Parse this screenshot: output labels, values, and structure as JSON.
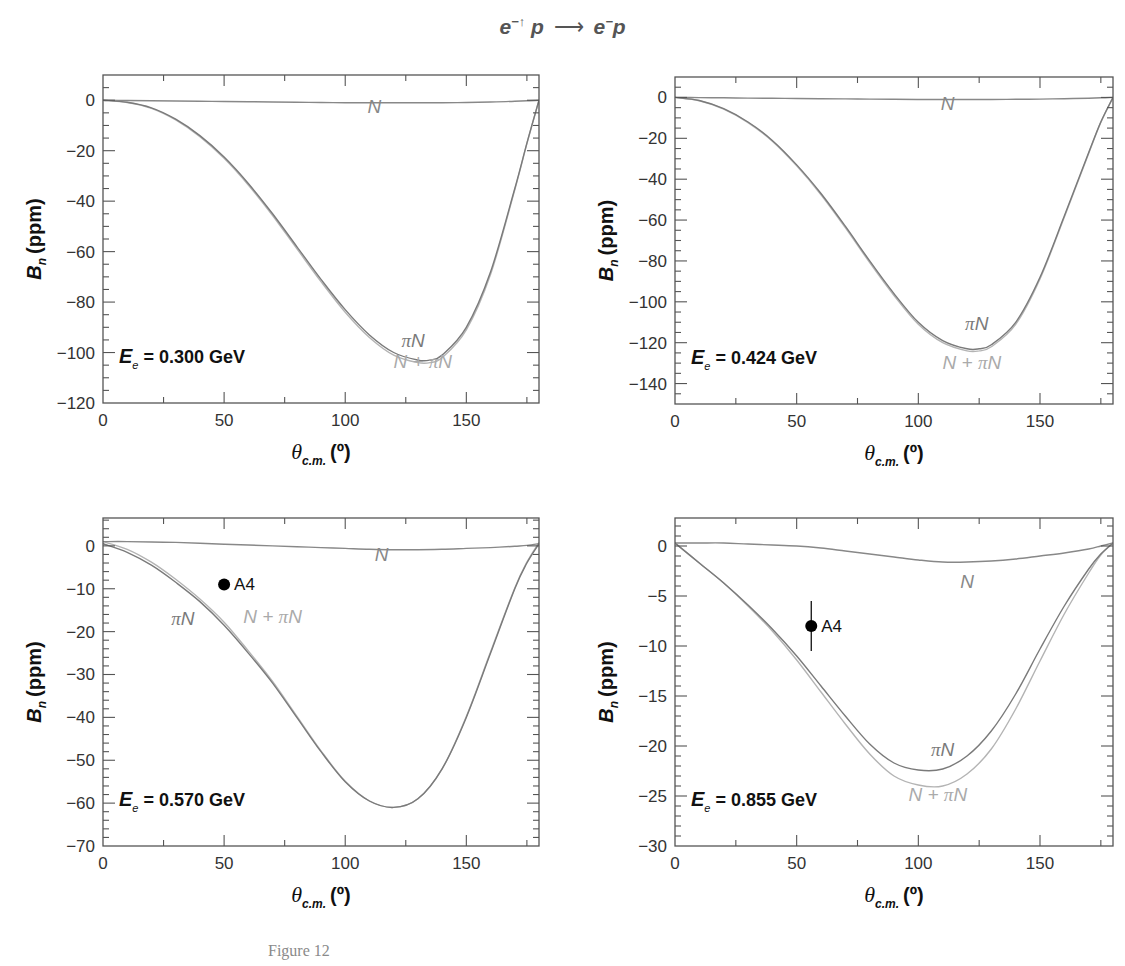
{
  "figure": {
    "title_parts": {
      "lhs1": "e",
      "lhs1_sup": "−↑",
      "lhs2": "p",
      "arrow": "⟶",
      "rhs1": "e",
      "rhs1_sup": "−",
      "rhs2": "p"
    },
    "title_text": "e−↑ p → e− p",
    "caption": "Figure 12"
  },
  "colors": {
    "axis": "#555555",
    "curve_N": "#888888",
    "curve_piN": "#7a7a7a",
    "curve_NpiN": "#b4b4b4",
    "label_N": "#888888",
    "label_piN": "#7a7a7a",
    "label_NpiN": "#aaaaaa",
    "point": "#000000",
    "text": "#222222"
  },
  "chart_data": [
    {
      "type": "line",
      "panel": "top-left",
      "energy_label": "E_e = 0.300 GeV",
      "energy_value": "0.300 GeV",
      "xlabel": "θ_c.m. (°)",
      "ylabel": "B_n (ppm)",
      "xlim": [
        0,
        180
      ],
      "ylim": [
        -120,
        10
      ],
      "xticks": [
        0,
        50,
        100,
        150
      ],
      "yticks": [
        0,
        -20,
        -40,
        -60,
        -80,
        -100,
        -120
      ],
      "x": [
        0,
        10,
        20,
        30,
        40,
        50,
        60,
        70,
        80,
        90,
        100,
        110,
        120,
        130,
        135,
        140,
        150,
        160,
        170,
        175,
        180
      ],
      "series": [
        {
          "name": "N",
          "values": [
            0,
            -0.1,
            -0.2,
            -0.3,
            -0.4,
            -0.5,
            -0.6,
            -0.7,
            -0.8,
            -0.9,
            -1.0,
            -1.0,
            -1.0,
            -1.0,
            -1.0,
            -1.0,
            -0.9,
            -0.7,
            -0.4,
            -0.2,
            0
          ]
        },
        {
          "name": "πN",
          "values": [
            0,
            -0.8,
            -3,
            -7.5,
            -14,
            -22.5,
            -33,
            -45,
            -58,
            -71,
            -83,
            -93,
            -100,
            -103,
            -103,
            -101,
            -90,
            -68,
            -35,
            -17,
            0
          ]
        },
        {
          "name": "N + πN",
          "values": [
            0,
            -0.9,
            -3.2,
            -7.8,
            -14.4,
            -23,
            -33.6,
            -45.7,
            -58.8,
            -71.9,
            -84,
            -94,
            -101,
            -104,
            -104,
            -102,
            -91,
            -69,
            -35.5,
            -17.2,
            0
          ]
        }
      ],
      "labels": [
        {
          "text": "N",
          "x": 112,
          "y": -5
        },
        {
          "text": "πN",
          "x": 128,
          "y": -98
        },
        {
          "text": "N + πN",
          "x": 132,
          "y": -106
        }
      ],
      "points": []
    },
    {
      "type": "line",
      "panel": "top-right",
      "energy_label": "E_e = 0.424 GeV",
      "energy_value": "0.424 GeV",
      "xlabel": "θ_c.m. (°)",
      "ylabel": "B_n (ppm)",
      "xlim": [
        0,
        180
      ],
      "ylim": [
        -150,
        10
      ],
      "xticks": [
        0,
        50,
        100,
        150
      ],
      "yticks": [
        0,
        -20,
        -40,
        -60,
        -80,
        -100,
        -120,
        -140
      ],
      "x": [
        0,
        10,
        20,
        30,
        40,
        50,
        60,
        70,
        80,
        90,
        100,
        110,
        120,
        125,
        130,
        140,
        150,
        160,
        170,
        175,
        180
      ],
      "series": [
        {
          "name": "N",
          "values": [
            0,
            -0.1,
            -0.2,
            -0.3,
            -0.4,
            -0.5,
            -0.6,
            -0.7,
            -0.8,
            -0.9,
            -1.0,
            -1.0,
            -1.0,
            -1.0,
            -1.0,
            -0.9,
            -0.8,
            -0.6,
            -0.4,
            -0.2,
            0
          ]
        },
        {
          "name": "πN",
          "values": [
            0,
            -1.5,
            -5.5,
            -12,
            -21,
            -33,
            -47,
            -63,
            -80,
            -96,
            -110,
            -119,
            -123,
            -123,
            -121,
            -110,
            -88,
            -58,
            -27,
            -12,
            0
          ]
        },
        {
          "name": "N + πN",
          "values": [
            0,
            -1.6,
            -5.7,
            -12.3,
            -21.4,
            -33.5,
            -47.6,
            -63.7,
            -80.8,
            -96.9,
            -111,
            -120,
            -124,
            -124,
            -122,
            -111,
            -88.8,
            -58.6,
            -27.4,
            -12.2,
            0
          ]
        }
      ],
      "labels": [
        {
          "text": "N",
          "x": 112,
          "y": -6
        },
        {
          "text": "πN",
          "x": 124,
          "y": -114
        },
        {
          "text": "N + πN",
          "x": 122,
          "y": -133
        }
      ],
      "points": []
    },
    {
      "type": "line",
      "panel": "bottom-left",
      "energy_label": "E_e = 0.570 GeV",
      "energy_value": "0.570 GeV",
      "xlabel": "θ_c.m. (°)",
      "ylabel": "B_n (ppm)",
      "xlim": [
        0,
        180
      ],
      "ylim": [
        -70,
        6.5
      ],
      "xticks": [
        0,
        50,
        100,
        150
      ],
      "yticks": [
        0,
        -10,
        -20,
        -30,
        -40,
        -50,
        -60,
        -70
      ],
      "x": [
        0,
        10,
        20,
        30,
        40,
        50,
        60,
        70,
        80,
        90,
        100,
        110,
        120,
        130,
        140,
        150,
        160,
        170,
        175,
        180
      ],
      "series": [
        {
          "name": "N",
          "values": [
            1,
            1,
            0.9,
            0.8,
            0.6,
            0.4,
            0.2,
            0,
            -0.2,
            -0.4,
            -0.6,
            -0.8,
            -0.9,
            -0.9,
            -0.8,
            -0.6,
            -0.4,
            -0.1,
            0.1,
            0.5
          ]
        },
        {
          "name": "πN",
          "values": [
            0.5,
            -1.5,
            -4.5,
            -8.5,
            -13,
            -18.5,
            -25,
            -32,
            -40,
            -48,
            -55,
            -59.5,
            -61,
            -59,
            -52,
            -40,
            -25,
            -10,
            -4,
            0.5
          ]
        },
        {
          "name": "N + πN",
          "values": [
            1,
            -0.8,
            -3.8,
            -7.8,
            -12.4,
            -17.8,
            -24.5,
            -31.6,
            -39.7,
            -47.8,
            -54.9,
            -59.5,
            -61,
            -59,
            -52,
            -39.8,
            -24.7,
            -9.8,
            -3.8,
            0.8
          ]
        }
      ],
      "labels": [
        {
          "text": "N",
          "x": 115,
          "y": -3.5
        },
        {
          "text": "πN",
          "x": 33,
          "y": -18.5
        },
        {
          "text": "N + πN",
          "x": 70,
          "y": -18
        }
      ],
      "points": [
        {
          "name": "A4",
          "x": 50,
          "y": -9,
          "yerr": [
            0,
            0
          ]
        }
      ]
    },
    {
      "type": "line",
      "panel": "bottom-right",
      "energy_label": "E_e = 0.855 GeV",
      "energy_value": "0.855 GeV",
      "xlabel": "θ_c.m. (°)",
      "ylabel": "B_n (ppm)",
      "xlim": [
        0,
        180
      ],
      "ylim": [
        -30,
        2.8
      ],
      "xticks": [
        0,
        50,
        100,
        150
      ],
      "yticks": [
        0,
        -5,
        -10,
        -15,
        -20,
        -25,
        -30
      ],
      "x": [
        0,
        10,
        20,
        30,
        40,
        50,
        60,
        70,
        80,
        90,
        100,
        110,
        120,
        130,
        140,
        150,
        160,
        170,
        175,
        180
      ],
      "series": [
        {
          "name": "N",
          "values": [
            0.3,
            0.3,
            0.3,
            0.2,
            0.1,
            0,
            -0.2,
            -0.5,
            -0.8,
            -1.1,
            -1.4,
            -1.6,
            -1.6,
            -1.5,
            -1.3,
            -1.0,
            -0.7,
            -0.3,
            0,
            0.3
          ]
        },
        {
          "name": "πN",
          "values": [
            0.3,
            -1.7,
            -3.7,
            -5.9,
            -8.3,
            -11,
            -14,
            -17,
            -19.8,
            -21.7,
            -22.4,
            -22.3,
            -21,
            -18.5,
            -14.8,
            -10.3,
            -6,
            -2.3,
            -0.8,
            0.3
          ]
        },
        {
          "name": "N + πN",
          "values": [
            0.3,
            -1.7,
            -3.7,
            -6,
            -8.5,
            -11.4,
            -14.6,
            -17.8,
            -20.8,
            -23,
            -23.9,
            -24,
            -22.8,
            -20.3,
            -16.3,
            -11.5,
            -6.8,
            -2.7,
            -0.9,
            0.3
          ]
        }
      ],
      "labels": [
        {
          "text": "N",
          "x": 120,
          "y": -4.2
        },
        {
          "text": "πN",
          "x": 110,
          "y": -21
        },
        {
          "text": "N + πN",
          "x": 108,
          "y": -25.5
        }
      ],
      "points": [
        {
          "name": "A4",
          "x": 56,
          "y": -8,
          "yerr": [
            2.5,
            2.5
          ]
        }
      ]
    }
  ],
  "layout_frames": [
    {
      "left": 103,
      "top": 75,
      "right": 539,
      "bottom": 403
    },
    {
      "left": 675,
      "top": 77,
      "right": 1113,
      "bottom": 404
    },
    {
      "left": 103,
      "top": 518,
      "right": 539,
      "bottom": 846
    },
    {
      "left": 675,
      "top": 518,
      "right": 1113,
      "bottom": 846
    }
  ]
}
